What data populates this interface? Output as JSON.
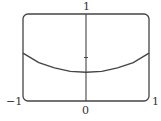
{
  "chart_data": {
    "type": "line",
    "title": "",
    "xlabel": "",
    "ylabel": "",
    "xlim": [
      -1,
      1
    ],
    "ylim": [
      0,
      1
    ],
    "grid": false,
    "legend": null,
    "tick_labels": {
      "x_left": "−1",
      "x_center": "0",
      "x_right": "1",
      "y_top": "1"
    },
    "y_ticks": [
      0.5
    ],
    "series": [
      {
        "name": "curve",
        "x": [
          -1,
          -0.75,
          -0.5,
          -0.25,
          0,
          0.25,
          0.5,
          0.75,
          1
        ],
        "y": [
          0.55,
          0.44,
          0.38,
          0.34,
          0.33,
          0.34,
          0.38,
          0.44,
          0.55
        ]
      }
    ],
    "colors": {
      "frame": "#444444",
      "curve": "#444444",
      "axis": "#444444"
    }
  }
}
